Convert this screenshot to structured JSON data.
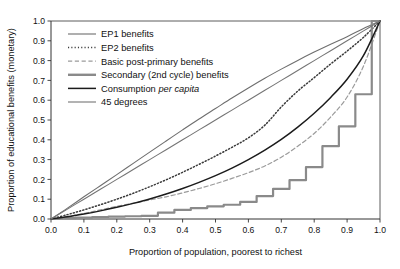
{
  "chart_data": {
    "type": "line",
    "title": "",
    "xlabel": "Proportion of population, poorest to richest",
    "ylabel": "Proportion of educational benefits (monetary)",
    "xlim": [
      0.0,
      1.0
    ],
    "ylim": [
      0.0,
      1.0
    ],
    "grid": false,
    "legend_position": "top-left inside",
    "xticks": [
      "0.0",
      "0.1",
      "0.2",
      "0.3",
      "0.4",
      "0.5",
      "0.6",
      "0.7",
      "0.8",
      "0.9",
      "1.0"
    ],
    "yticks": [
      "0.0",
      "0.1",
      "0.2",
      "0.3",
      "0.4",
      "0.5",
      "0.6",
      "0.7",
      "0.8",
      "0.9",
      "1.0"
    ],
    "xtick_values": [
      0.0,
      0.1,
      0.2,
      0.3,
      0.4,
      0.5,
      0.6,
      0.7,
      0.8,
      0.9,
      1.0
    ],
    "ytick_values": [
      0.0,
      0.1,
      0.2,
      0.3,
      0.4,
      0.5,
      0.6,
      0.7,
      0.8,
      0.9,
      1.0
    ],
    "x": [
      0.0,
      0.05,
      0.1,
      0.15,
      0.2,
      0.25,
      0.3,
      0.35,
      0.4,
      0.45,
      0.5,
      0.55,
      0.6,
      0.65,
      0.7,
      0.75,
      0.8,
      0.85,
      0.9,
      0.95,
      1.0
    ],
    "series": [
      {
        "name": "EP1 benefits",
        "style": "solid",
        "color": "#6e6e6e",
        "width": 1.1,
        "values": [
          0.0,
          0.055,
          0.112,
          0.168,
          0.224,
          0.281,
          0.338,
          0.394,
          0.45,
          0.505,
          0.558,
          0.611,
          0.662,
          0.711,
          0.757,
          0.801,
          0.843,
          0.883,
          0.921,
          0.962,
          1.0
        ]
      },
      {
        "name": "EP2 benefits",
        "style": "dotted",
        "color": "#3a3a3a",
        "width": 1.5,
        "values": [
          0.0,
          0.022,
          0.046,
          0.072,
          0.1,
          0.13,
          0.163,
          0.198,
          0.236,
          0.276,
          0.318,
          0.362,
          0.41,
          0.474,
          0.566,
          0.646,
          0.714,
          0.783,
          0.848,
          0.918,
          1.0
        ]
      },
      {
        "name": "Basic post-primary benefits",
        "style": "dashed",
        "color": "#9b9b9b",
        "width": 1.2,
        "values": [
          0.0,
          0.012,
          0.028,
          0.046,
          0.064,
          0.08,
          0.096,
          0.112,
          0.132,
          0.154,
          0.178,
          0.205,
          0.234,
          0.268,
          0.312,
          0.368,
          0.432,
          0.515,
          0.616,
          0.773,
          1.0
        ]
      },
      {
        "name": "Secondary (2nd cycle) benefits",
        "style": "step",
        "color": "#8a8a8a",
        "width": 2.2,
        "values": [
          0.0,
          0.004,
          0.007,
          0.01,
          0.012,
          0.014,
          0.016,
          0.032,
          0.046,
          0.055,
          0.064,
          0.072,
          0.086,
          0.116,
          0.152,
          0.196,
          0.262,
          0.368,
          0.468,
          0.63,
          1.0
        ]
      },
      {
        "name": "Consumption per capita",
        "style": "solid",
        "color": "#1b1b1b",
        "width": 1.5,
        "values": [
          0.0,
          0.011,
          0.025,
          0.041,
          0.059,
          0.079,
          0.101,
          0.126,
          0.154,
          0.185,
          0.219,
          0.257,
          0.3,
          0.348,
          0.402,
          0.464,
          0.534,
          0.614,
          0.706,
          0.826,
          1.0
        ]
      },
      {
        "name": "45 degrees",
        "style": "solid",
        "color": "#757575",
        "width": 1.1,
        "values": [
          0.0,
          0.05,
          0.1,
          0.15,
          0.2,
          0.25,
          0.3,
          0.35,
          0.4,
          0.45,
          0.5,
          0.55,
          0.6,
          0.65,
          0.7,
          0.75,
          0.8,
          0.85,
          0.9,
          0.95,
          1.0
        ]
      }
    ],
    "legend_entries": [
      {
        "label": "EP1 benefits",
        "label_plain": "EP1 benefits",
        "label_italic": ""
      },
      {
        "label": "EP2 benefits",
        "label_plain": "EP2 benefits",
        "label_italic": ""
      },
      {
        "label": "Basic post-primary benefits",
        "label_plain": "Basic post-primary benefits",
        "label_italic": ""
      },
      {
        "label": "Secondary (2nd cycle) benefits",
        "label_plain": "Secondary (2nd cycle) benefits",
        "label_italic": ""
      },
      {
        "label": "Consumption per capita",
        "label_plain": "Consumption ",
        "label_italic": "per capita"
      },
      {
        "label": "45 degrees",
        "label_plain": "45 degrees",
        "label_italic": ""
      }
    ]
  },
  "colors": {
    "axis": "#333333",
    "background": "#ffffff",
    "text": "#111111"
  }
}
